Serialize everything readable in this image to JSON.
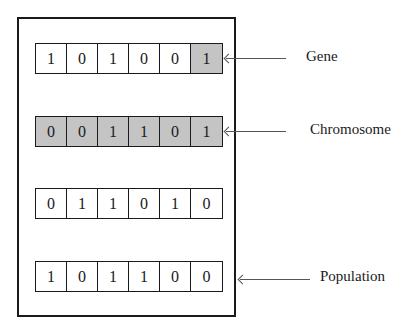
{
  "diagram": {
    "rows": [
      {
        "name": "row-1",
        "top": 43,
        "cells": [
          {
            "value": "1",
            "shaded": false
          },
          {
            "value": "0",
            "shaded": false
          },
          {
            "value": "1",
            "shaded": false
          },
          {
            "value": "0",
            "shaded": false
          },
          {
            "value": "0",
            "shaded": false
          },
          {
            "value": "1",
            "shaded": true
          }
        ]
      },
      {
        "name": "row-2",
        "top": 116,
        "cells": [
          {
            "value": "0",
            "shaded": true
          },
          {
            "value": "0",
            "shaded": true
          },
          {
            "value": "1",
            "shaded": true
          },
          {
            "value": "1",
            "shaded": true
          },
          {
            "value": "0",
            "shaded": true
          },
          {
            "value": "1",
            "shaded": true
          }
        ]
      },
      {
        "name": "row-3",
        "top": 188,
        "cells": [
          {
            "value": "0",
            "shaded": false
          },
          {
            "value": "1",
            "shaded": false
          },
          {
            "value": "1",
            "shaded": false
          },
          {
            "value": "0",
            "shaded": false
          },
          {
            "value": "1",
            "shaded": false
          },
          {
            "value": "0",
            "shaded": false
          }
        ]
      },
      {
        "name": "row-4",
        "top": 261,
        "cells": [
          {
            "value": "1",
            "shaded": false
          },
          {
            "value": "0",
            "shaded": false
          },
          {
            "value": "1",
            "shaded": false
          },
          {
            "value": "1",
            "shaded": false
          },
          {
            "value": "0",
            "shaded": false
          },
          {
            "value": "0",
            "shaded": false
          }
        ]
      }
    ],
    "labels": {
      "gene": "Gene",
      "chromosome": "Chromosome",
      "population": "Population"
    },
    "colors": {
      "shaded_cell": "#c4c4c4",
      "line": "#1a1a1a"
    }
  }
}
